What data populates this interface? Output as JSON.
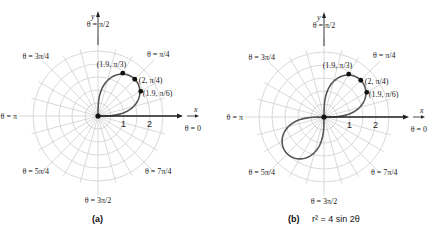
{
  "figure": {
    "panels": [
      {
        "id": "a",
        "caption": "(a)",
        "equation": "",
        "center": [
          98,
          116
        ],
        "unit_px": 26,
        "curve": "first_quadrant_loop",
        "points": [
          {
            "label_r": "1.9",
            "label_theta": "π/3",
            "r": 1.9,
            "theta_deg": 60
          },
          {
            "label_r": "2",
            "label_theta": "π/4",
            "r": 2,
            "theta_deg": 45
          },
          {
            "label_r": "1.9",
            "label_theta": "π/6",
            "r": 1.9,
            "theta_deg": 30
          }
        ]
      },
      {
        "id": "b",
        "caption": "(b)",
        "equation": "r² = 4 sin 2θ",
        "center": [
          324,
          117
        ],
        "unit_px": 26,
        "curve": "lemniscate",
        "points": [
          {
            "label_r": "1.9",
            "label_theta": "π/3",
            "r": 1.9,
            "theta_deg": 60
          },
          {
            "label_r": "2",
            "label_theta": "π/4",
            "r": 2,
            "theta_deg": 45
          },
          {
            "label_r": "1.9",
            "label_theta": "π/6",
            "r": 1.9,
            "theta_deg": 30
          }
        ]
      }
    ],
    "angle_labels": [
      {
        "text": "θ = π/2",
        "deg": 90
      },
      {
        "text": "θ = π/4",
        "deg": 45
      },
      {
        "text": "θ = 3π/4",
        "deg": 135
      },
      {
        "text": "θ = π",
        "deg": 180
      },
      {
        "text": "θ = 0",
        "deg": 0
      },
      {
        "text": "θ = 5π/4",
        "deg": 225
      },
      {
        "text": "θ = 3π/2",
        "deg": 270
      },
      {
        "text": "θ = 7π/4",
        "deg": 315
      }
    ],
    "axis_labels": {
      "x": "x",
      "y": "y"
    },
    "ring_labels": [
      "1",
      "2"
    ],
    "grid": {
      "rings": [
        0.5,
        1,
        1.5,
        2,
        2.5
      ],
      "spoke_step_deg": 15
    },
    "colors": {
      "grid": "#c8c8c8",
      "curve": "#555555",
      "axis": "#222222"
    }
  }
}
